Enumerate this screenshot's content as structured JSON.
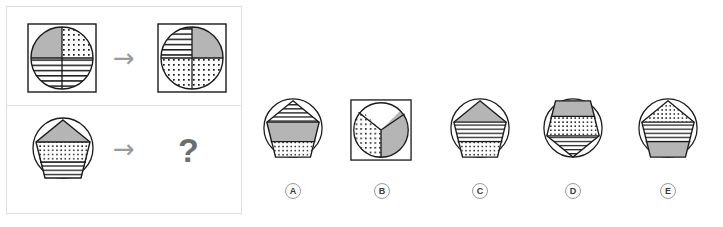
{
  "puzzle": {
    "type": "visual-analogy-matrix",
    "colors": {
      "gray_fill": "#b5b5b5",
      "stroke": "#1a1a1a",
      "panel_border": "#dedede",
      "arrow": "#9a9a9a",
      "question_mark": "#6e6e6e",
      "white_fill": "#ffffff"
    },
    "panel": {
      "rows": [
        {
          "name": "example-row",
          "source": {
            "shape": "circle-in-square",
            "divisions": "quadrants",
            "regions": [
              {
                "position": "top-left",
                "fill": "gray"
              },
              {
                "position": "top-right",
                "fill": "dots"
              },
              {
                "position": "bottom-left",
                "fill": "lines"
              },
              {
                "position": "bottom-right",
                "fill": "lines"
              }
            ]
          },
          "operator": "→",
          "result": {
            "shape": "circle-in-square",
            "divisions": "quadrants",
            "regions": [
              {
                "position": "top-left",
                "fill": "lines"
              },
              {
                "position": "top-right",
                "fill": "gray"
              },
              {
                "position": "bottom-left",
                "fill": "dots"
              },
              {
                "position": "bottom-right",
                "fill": "dots"
              }
            ]
          }
        },
        {
          "name": "question-row",
          "source": {
            "shape": "pentagon-in-circle",
            "orientation": "point-up",
            "regions": [
              {
                "position": "top-triangle",
                "fill": "gray"
              },
              {
                "position": "middle-band",
                "fill": "dots"
              },
              {
                "position": "bottom-band",
                "fill": "lines"
              }
            ]
          },
          "operator": "→",
          "result": "?"
        }
      ]
    },
    "options": [
      {
        "letter": "A",
        "shape": "pentagon-in-circle",
        "orientation": "point-up",
        "regions": [
          {
            "position": "top-triangle",
            "fill": "lines"
          },
          {
            "position": "middle-band",
            "fill": "gray"
          },
          {
            "position": "bottom-band",
            "fill": "dots"
          }
        ]
      },
      {
        "letter": "B",
        "shape": "circle-in-square",
        "divisions": "thirds",
        "regions": [
          {
            "position": "top-sector",
            "fill": "white"
          },
          {
            "position": "lower-left-sector",
            "fill": "dots"
          },
          {
            "position": "right-sector",
            "fill": "gray"
          }
        ]
      },
      {
        "letter": "C",
        "shape": "pentagon-in-circle",
        "orientation": "point-up",
        "regions": [
          {
            "position": "top-triangle",
            "fill": "gray"
          },
          {
            "position": "middle-band",
            "fill": "lines"
          },
          {
            "position": "bottom-band",
            "fill": "dots"
          }
        ]
      },
      {
        "letter": "D",
        "shape": "pentagon-in-circle",
        "orientation": "point-down",
        "regions": [
          {
            "position": "top-band",
            "fill": "gray"
          },
          {
            "position": "middle-band",
            "fill": "dots"
          },
          {
            "position": "bottom-triangle",
            "fill": "lines"
          }
        ]
      },
      {
        "letter": "E",
        "shape": "pentagon-in-circle",
        "orientation": "point-up",
        "regions": [
          {
            "position": "top-triangle",
            "fill": "dots"
          },
          {
            "position": "middle-band",
            "fill": "lines"
          },
          {
            "position": "bottom-band",
            "fill": "gray"
          }
        ]
      }
    ]
  }
}
